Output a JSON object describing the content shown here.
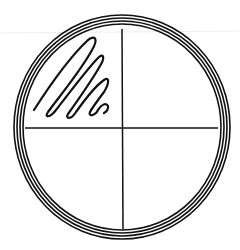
{
  "diagram": {
    "dish": {
      "center": [
        122,
        127
      ],
      "rings": [
        {
          "rx": 108,
          "ry": 112
        },
        {
          "rx": 105,
          "ry": 109
        },
        {
          "rx": 102,
          "ry": 106
        },
        {
          "rx": 99,
          "ry": 103
        }
      ],
      "color": "#111111"
    },
    "quadrant_dividers": {
      "vertical": {
        "x": 122,
        "y1": 29,
        "y2": 229
      },
      "horizontal": {
        "y": 128,
        "x1": 25,
        "x2": 218
      }
    },
    "streak": {
      "quadrant": "upper-left",
      "passes": 4
    }
  }
}
